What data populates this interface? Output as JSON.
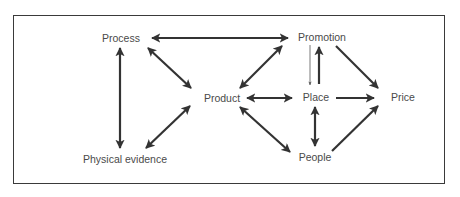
{
  "diagram": {
    "type": "relationship-diagram",
    "colors": {
      "arrow": "#333333",
      "text": "#4a4a4a",
      "border": "#3a3a3a",
      "background": "#ffffff"
    },
    "nodes": [
      {
        "id": "process",
        "label": "Process"
      },
      {
        "id": "promotion",
        "label": "Promotion"
      },
      {
        "id": "product",
        "label": "Product"
      },
      {
        "id": "place",
        "label": "Place"
      },
      {
        "id": "price",
        "label": "Price"
      },
      {
        "id": "physical_evidence",
        "label": "Physical evidence"
      },
      {
        "id": "people",
        "label": "People"
      }
    ],
    "edges": [
      {
        "from": "process",
        "to": "promotion",
        "direction": "both"
      },
      {
        "from": "process",
        "to": "product",
        "direction": "both"
      },
      {
        "from": "process",
        "to": "physical_evidence",
        "direction": "both"
      },
      {
        "from": "physical_evidence",
        "to": "product",
        "direction": "both"
      },
      {
        "from": "promotion",
        "to": "product",
        "direction": "both"
      },
      {
        "from": "promotion",
        "to": "place",
        "direction": "forward",
        "weight": "thin"
      },
      {
        "from": "place",
        "to": "promotion",
        "direction": "forward",
        "weight": "thick"
      },
      {
        "from": "promotion",
        "to": "price",
        "direction": "forward"
      },
      {
        "from": "product",
        "to": "place",
        "direction": "both"
      },
      {
        "from": "place",
        "to": "price",
        "direction": "forward"
      },
      {
        "from": "place",
        "to": "people",
        "direction": "both"
      },
      {
        "from": "product",
        "to": "people",
        "direction": "both"
      },
      {
        "from": "people",
        "to": "price",
        "direction": "forward"
      }
    ]
  }
}
